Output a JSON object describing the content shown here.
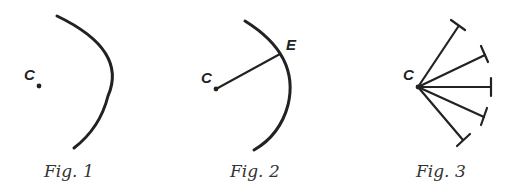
{
  "figures": [
    {
      "caption": "Fig. 1",
      "labels": {
        "center": "C"
      }
    },
    {
      "caption": "Fig. 2",
      "labels": {
        "center": "C",
        "edge_point": "E"
      }
    },
    {
      "caption": "Fig. 3",
      "labels": {
        "center": "C"
      },
      "ray_count": 5
    }
  ],
  "colors": {
    "ink": "#222222",
    "background": "#ffffff"
  }
}
